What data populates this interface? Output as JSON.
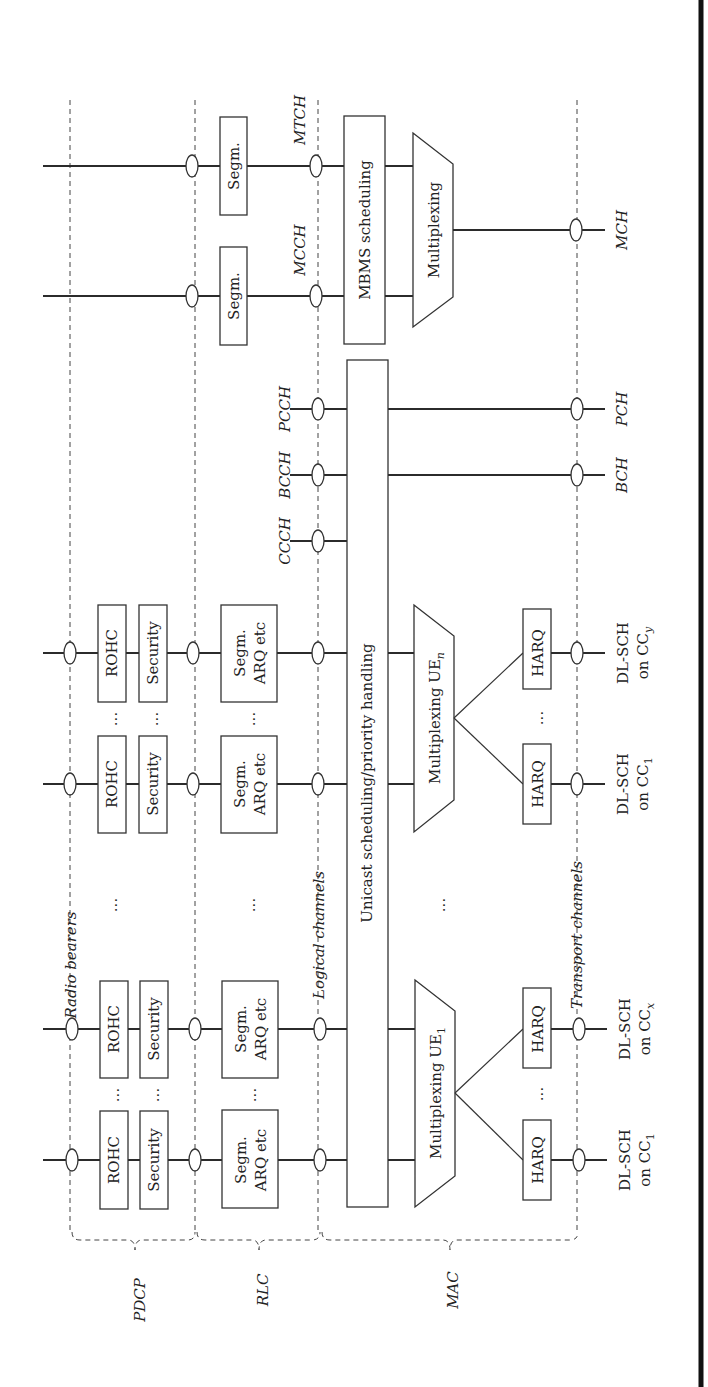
{
  "diagram": {
    "layers": {
      "pdcp": "PDCP",
      "rlc": "RLC",
      "mac": "MAC"
    },
    "interfaces": {
      "radio_bearers": "Radio bearers",
      "logical_channels": "Logical channels",
      "transport_channels": "Transport channels"
    },
    "blocks": {
      "rohc": "ROHC",
      "security": "Security",
      "segm_arq_line1": "Segm.",
      "segm_arq_line2": "ARQ etc",
      "segm": "Segm.",
      "unicast": "Unicast scheduling/priority handling",
      "mbms": "MBMS scheduling",
      "multiplexing": "Multiplexing",
      "mux_ue1": "Multiplexing UE",
      "mux_ue1_sub": "1",
      "mux_uen": "Multiplexing UE",
      "mux_uen_sub": "n",
      "harq": "HARQ",
      "ellipsis": "..."
    },
    "logical_channels": [
      "CCCH",
      "BCCH",
      "PCCH",
      "MCCH",
      "MTCH"
    ],
    "transport_channels": {
      "bch": "BCH",
      "pch": "PCH",
      "mch": "MCH",
      "dlsch": "DL-SCH",
      "on_cc": "on CC",
      "ue1": [
        "1",
        "x"
      ],
      "uen": [
        "1",
        "y"
      ]
    }
  }
}
